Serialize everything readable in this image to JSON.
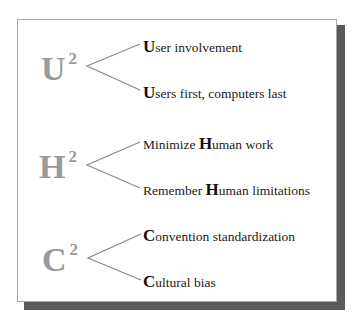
{
  "groups": [
    {
      "letter": "U",
      "exponent": "2",
      "items": [
        {
          "pre": "",
          "initial": "U",
          "rest": "ser involvement"
        },
        {
          "pre": "",
          "initial": "U",
          "rest": "sers first, computers last"
        }
      ]
    },
    {
      "letter": "H",
      "exponent": "2",
      "items": [
        {
          "pre": "Minimize ",
          "initial": "H",
          "rest": "uman work"
        },
        {
          "pre": "Remember ",
          "initial": "H",
          "rest": "uman limitations"
        }
      ]
    },
    {
      "letter": "C",
      "exponent": "2",
      "items": [
        {
          "pre": "",
          "initial": "C",
          "rest": "onvention standardization"
        },
        {
          "pre": "",
          "initial": "C",
          "rest": "ultural bias"
        }
      ]
    }
  ],
  "colors": {
    "big_letter": "#9a9a9a",
    "branch_line": "#8a8a8a",
    "border": "#a8a8a8",
    "shadow": "#5a5a5a"
  }
}
